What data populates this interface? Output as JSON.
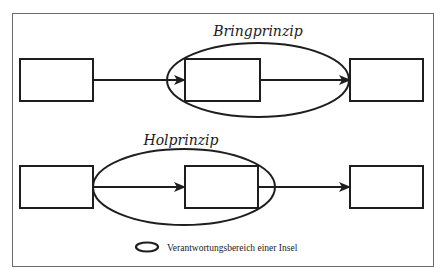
{
  "diagram": {
    "colors": {
      "stroke": "#1e1e1e",
      "frame": "#6a6a6a",
      "background": "#ffffff"
    },
    "rows": [
      {
        "title": "Bringprinzip",
        "boxes": [
          "Box 1",
          "Box 2",
          "Box 3"
        ],
        "island_scope": "covers box 2 and incoming arrow head, extends to box 3"
      },
      {
        "title": "Holprinzip",
        "boxes": [
          "Box 1",
          "Box 2",
          "Box 3"
        ],
        "island_scope": "covers box 1 edge, arrow and box 2"
      }
    ],
    "legend": {
      "icon": "ellipse-icon",
      "label": "Verantwortungsbereich einer Insel"
    }
  }
}
